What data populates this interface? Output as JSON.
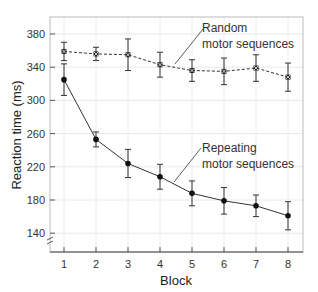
{
  "chart_data": {
    "type": "line",
    "title": "",
    "xlabel": "Block",
    "ylabel": "Reaction time (ms)",
    "x": [
      1,
      2,
      3,
      4,
      5,
      6,
      7,
      8
    ],
    "ylim": [
      130,
      395
    ],
    "yticks": [
      140,
      180,
      220,
      260,
      300,
      340,
      380
    ],
    "grid": true,
    "series": [
      {
        "name": "Random motor sequences",
        "style": "dashed",
        "marker": "x-square",
        "values": [
          359,
          356,
          355,
          343,
          336,
          335,
          339,
          328
        ],
        "errors": [
          11,
          8,
          19,
          15,
          13,
          16,
          16,
          17
        ]
      },
      {
        "name": "Repeating motor sequences",
        "style": "solid",
        "marker": "circle",
        "values": [
          325,
          253,
          224,
          208,
          188,
          179,
          173,
          161
        ],
        "errors": [
          19,
          9,
          17,
          15,
          15,
          16,
          13,
          17
        ]
      }
    ],
    "annotations": [
      {
        "lines": [
          "Random",
          "motor sequences"
        ],
        "target_series": 0
      },
      {
        "lines": [
          "Repeating",
          "motor sequences"
        ],
        "target_series": 1
      }
    ],
    "axis_break": true
  }
}
